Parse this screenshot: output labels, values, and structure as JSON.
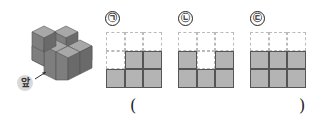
{
  "figure": {
    "front_label": "앞",
    "cube_color": "#8c8c8c"
  },
  "options": [
    {
      "label": "㉠",
      "rows": [
        [
          0,
          0,
          0
        ],
        [
          0,
          1,
          1
        ],
        [
          1,
          1,
          1
        ]
      ]
    },
    {
      "label": "㉡",
      "rows": [
        [
          0,
          0,
          0
        ],
        [
          1,
          0,
          1
        ],
        [
          1,
          1,
          1
        ]
      ]
    },
    {
      "label": "㉢",
      "rows": [
        [
          0,
          0,
          0
        ],
        [
          1,
          1,
          1
        ],
        [
          1,
          1,
          1
        ]
      ]
    }
  ],
  "answer": {
    "open_paren": "(",
    "close_paren": ")",
    "value": ""
  },
  "colors": {
    "filled_cell": "#b4b4b4",
    "cell_border": "#555555",
    "empty_cell_border": "#bbbbbb"
  }
}
